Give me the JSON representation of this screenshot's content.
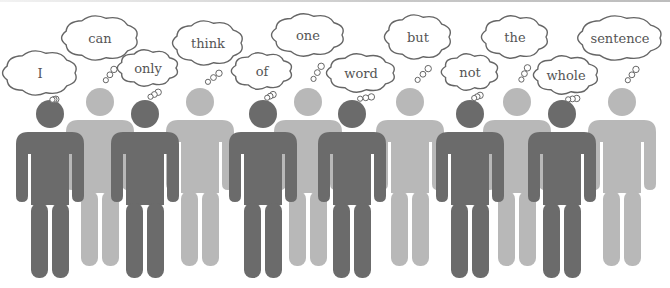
{
  "illustration": {
    "sentence": "I can only think of one word but not the whole sentence",
    "colors": {
      "dark_figure": "#6b6b6b",
      "light_figure": "#b8b8b8",
      "bubble_stroke": "#666666",
      "bubble_fill": "#ffffff",
      "text": "#555555"
    },
    "figures": [
      {
        "word": "I",
        "tone": "dark",
        "cx": 50,
        "bubble": {
          "x": 40,
          "y": 73,
          "w": 70,
          "h": 40
        }
      },
      {
        "word": "can",
        "tone": "light",
        "cx": 100,
        "bubble": {
          "x": 100,
          "y": 38,
          "w": 72,
          "h": 40
        }
      },
      {
        "word": "only",
        "tone": "dark",
        "cx": 145,
        "bubble": {
          "x": 148,
          "y": 68,
          "w": 56,
          "h": 32
        }
      },
      {
        "word": "think",
        "tone": "light",
        "cx": 200,
        "bubble": {
          "x": 208,
          "y": 43,
          "w": 66,
          "h": 40
        }
      },
      {
        "word": "of",
        "tone": "dark",
        "cx": 263,
        "bubble": {
          "x": 262,
          "y": 71,
          "w": 56,
          "h": 32
        }
      },
      {
        "word": "one",
        "tone": "light",
        "cx": 308,
        "bubble": {
          "x": 308,
          "y": 35,
          "w": 68,
          "h": 38
        }
      },
      {
        "word": "word",
        "tone": "dark",
        "cx": 352,
        "bubble": {
          "x": 361,
          "y": 73,
          "w": 64,
          "h": 34
        }
      },
      {
        "word": "but",
        "tone": "light",
        "cx": 410,
        "bubble": {
          "x": 418,
          "y": 37,
          "w": 62,
          "h": 40
        }
      },
      {
        "word": "not",
        "tone": "dark",
        "cx": 470,
        "bubble": {
          "x": 470,
          "y": 72,
          "w": 52,
          "h": 32
        }
      },
      {
        "word": "the",
        "tone": "light",
        "cx": 517,
        "bubble": {
          "x": 515,
          "y": 37,
          "w": 62,
          "h": 38
        }
      },
      {
        "word": "whole",
        "tone": "dark",
        "cx": 562,
        "bubble": {
          "x": 566,
          "y": 75,
          "w": 60,
          "h": 34
        }
      },
      {
        "word": "sentence",
        "tone": "light",
        "cx": 622,
        "bubble": {
          "x": 620,
          "y": 38,
          "w": 80,
          "h": 40
        }
      }
    ]
  }
}
